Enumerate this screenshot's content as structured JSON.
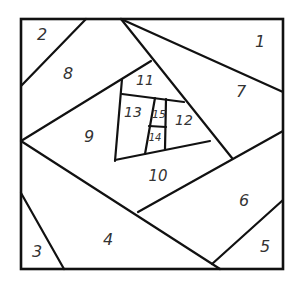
{
  "diagram": {
    "type": "pineapple-style spiral quilt block",
    "stroke_color": "#111111",
    "label_color": "#333333",
    "background": "#ffffff",
    "regions": [
      {
        "id": "1",
        "label": "1",
        "x": 260,
        "y": 42,
        "size": 16
      },
      {
        "id": "2",
        "label": "2",
        "x": 42,
        "y": 35,
        "size": 16
      },
      {
        "id": "3",
        "label": "3",
        "x": 37,
        "y": 252,
        "size": 16
      },
      {
        "id": "4",
        "label": "4",
        "x": 108,
        "y": 240,
        "size": 16
      },
      {
        "id": "5",
        "label": "5",
        "x": 265,
        "y": 247,
        "size": 16
      },
      {
        "id": "6",
        "label": "6",
        "x": 244,
        "y": 201,
        "size": 16
      },
      {
        "id": "7",
        "label": "7",
        "x": 241,
        "y": 92,
        "size": 16
      },
      {
        "id": "8",
        "label": "8",
        "x": 68,
        "y": 74,
        "size": 16
      },
      {
        "id": "9",
        "label": "9",
        "x": 89,
        "y": 137,
        "size": 16
      },
      {
        "id": "10",
        "label": "10",
        "x": 158,
        "y": 176,
        "size": 15
      },
      {
        "id": "11",
        "label": "11",
        "x": 145,
        "y": 81,
        "size": 14
      },
      {
        "id": "12",
        "label": "12",
        "x": 184,
        "y": 121,
        "size": 14
      },
      {
        "id": "13",
        "label": "13",
        "x": 133,
        "y": 113,
        "size": 14
      },
      {
        "id": "14",
        "label": "14",
        "x": 155,
        "y": 138,
        "size": 10
      },
      {
        "id": "15",
        "label": "15",
        "x": 159,
        "y": 115,
        "size": 11
      }
    ]
  }
}
